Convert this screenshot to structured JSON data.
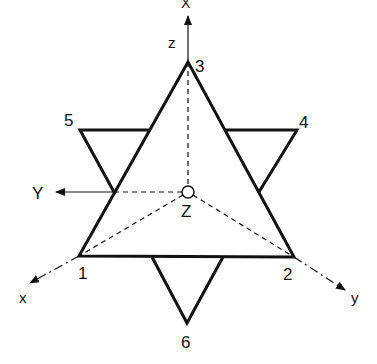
{
  "diagram": {
    "vertex_labels": {
      "v1": "1",
      "v2": "2",
      "v3": "3",
      "v4": "4",
      "v5": "5",
      "v6": "6"
    },
    "axis_labels": {
      "X_top": "X",
      "z": "z",
      "Y": "Y",
      "Z": "Z",
      "x": "x",
      "y": "y"
    },
    "colors": {
      "line": "#111111",
      "background": "#ffffff"
    }
  }
}
